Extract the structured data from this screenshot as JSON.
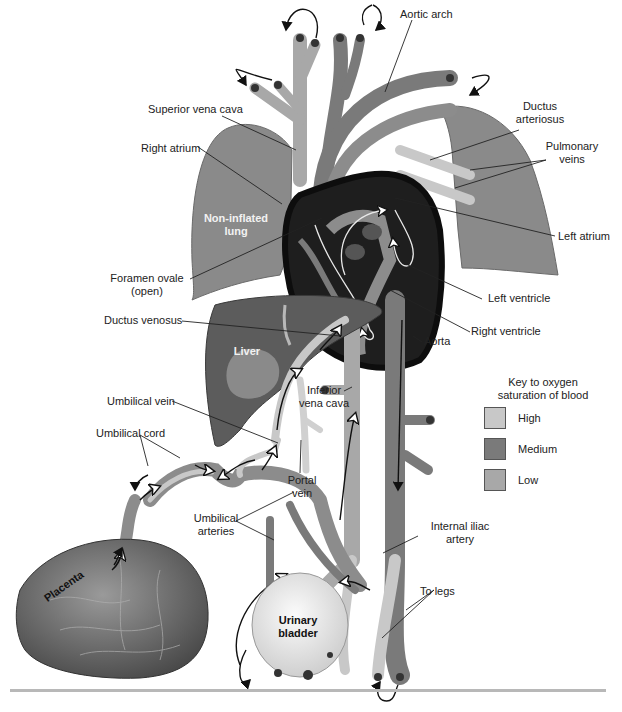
{
  "figure": {
    "labels": {
      "aortic_arch": "Aortic arch",
      "superior_vena_cava": "Superior vena cava",
      "ductus_arteriosus_1": "Ductus",
      "ductus_arteriosus_2": "arteriosus",
      "right_atrium": "Right atrium",
      "pulmonary_veins_1": "Pulmonary",
      "pulmonary_veins_2": "veins",
      "non_inflated_lung_1": "Non-inflated",
      "non_inflated_lung_2": "lung",
      "left_atrium": "Left atrium",
      "foramen_ovale_1": "Foramen ovale",
      "foramen_ovale_2": "(open)",
      "left_ventricle": "Left ventricle",
      "ductus_venosus": "Ductus venosus",
      "right_ventricle": "Right ventricle",
      "liver": "Liver",
      "aorta": "Aorta",
      "umbilical_vein": "Umbilical vein",
      "inferior_vena_cava_1": "Inferior",
      "inferior_vena_cava_2": "vena cava",
      "umbilical_cord": "Umbilical cord",
      "portal_vein_1": "Portal",
      "portal_vein_2": "vein",
      "umbilical_arteries_1": "Umbilical",
      "umbilical_arteries_2": "arteries",
      "internal_iliac_artery_1": "Internal iliac",
      "internal_iliac_artery_2": "artery",
      "placenta": "Placenta",
      "urinary_bladder_1": "Urinary",
      "urinary_bladder_2": "bladder",
      "to_legs": "To legs"
    }
  },
  "key": {
    "title_1": "Key to oxygen",
    "title_2": "saturation of blood",
    "items": [
      {
        "label": "High",
        "color": "#c8c8c8"
      },
      {
        "label": "Medium",
        "color": "#7a7a7a"
      },
      {
        "label": "Low",
        "color": "#a8a8a8"
      }
    ]
  },
  "colors": {
    "high": "#c8c8c8",
    "medium": "#7a7a7a",
    "low": "#a8a8a8",
    "lung": "#8a8a8a",
    "liver": "#5c5c5c",
    "heart_dark": "#1e1e1e",
    "placenta": "#6e6e6e",
    "bladder": "#e6e6e6"
  }
}
